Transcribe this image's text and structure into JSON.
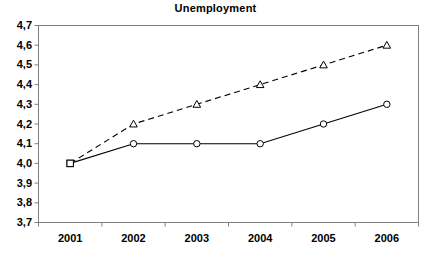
{
  "chart_data": {
    "type": "line",
    "title": "Unemployment",
    "xlabel": "",
    "ylabel": "",
    "categories": [
      "2001",
      "2002",
      "2003",
      "2004",
      "2005",
      "2006"
    ],
    "ytick_labels": [
      "4,7",
      "4,6",
      "4,5",
      "4,4",
      "4,3",
      "4,2",
      "4,1",
      "4,0",
      "3,9",
      "3,8",
      "3,7"
    ],
    "ytick_values": [
      4.7,
      4.6,
      4.5,
      4.4,
      4.3,
      4.2,
      4.1,
      4.0,
      3.9,
      3.8,
      3.7
    ],
    "ylim": [
      3.7,
      4.7
    ],
    "grid": false,
    "legend": "none",
    "decimal_separator": ",",
    "series": [
      {
        "name": "dashed-series",
        "values": [
          4.0,
          4.2,
          4.3,
          4.4,
          4.5,
          4.6
        ],
        "marker": "triangle",
        "line_style": "dashed",
        "color": "#000000"
      },
      {
        "name": "solid-series",
        "values": [
          4.0,
          4.1,
          4.1,
          4.1,
          4.2,
          4.3
        ],
        "marker": "circle",
        "line_style": "solid",
        "color": "#000000"
      }
    ]
  },
  "axes": {
    "frame_color": "#808080",
    "background": "#ffffff"
  }
}
